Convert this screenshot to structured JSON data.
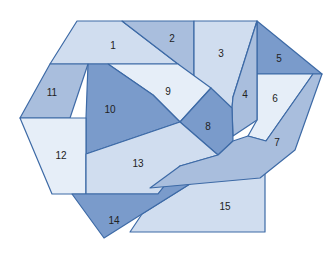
{
  "diagram": {
    "type": "dissection-puzzle",
    "colors": {
      "light": "#e6eef8",
      "pale": "#d0ddef",
      "mid": "#a9bedd",
      "dark": "#7a9bcb",
      "stroke": "#3d6aa6"
    },
    "pieces": [
      {
        "id": "1",
        "label": "1",
        "shade": "pale",
        "points": "77,21 122,21 178,64 50,64",
        "lx": 113,
        "ly": 46
      },
      {
        "id": "2",
        "label": "2",
        "shade": "mid",
        "points": "122,21 194,21 194,86 178,64",
        "lx": 172,
        "ly": 39
      },
      {
        "id": "3",
        "label": "3",
        "shade": "pale",
        "points": "194,21 257,21 233,97 232,108 194,86",
        "lx": 221,
        "ly": 54
      },
      {
        "id": "4",
        "label": "4",
        "shade": "mid",
        "points": "257,21 257,120 233,136 232,108 233,97",
        "lx": 245,
        "ly": 95
      },
      {
        "id": "5",
        "label": "5",
        "shade": "dark",
        "points": "257,21 322,74 257,74",
        "lx": 279,
        "ly": 59
      },
      {
        "id": "6",
        "label": "6",
        "shade": "light",
        "points": "257,74 313,74 266,141 248,136 257,120",
        "lx": 275,
        "ly": 99
      },
      {
        "id": "7",
        "label": "7",
        "shade": "mid",
        "points": "322,74 313,74 266,141 248,136 233,141 218,155 180,166 150,188 260,178 295,150",
        "lx": 277,
        "ly": 143
      },
      {
        "id": "8",
        "label": "8",
        "shade": "dark",
        "points": "211,88 232,108 233,141 218,155 180,122",
        "lx": 208,
        "ly": 127
      },
      {
        "id": "9",
        "label": "9",
        "shade": "light",
        "points": "108,64 178,64 211,88 180,122 153,95",
        "lx": 168,
        "ly": 92
      },
      {
        "id": "10",
        "label": "10",
        "shade": "dark",
        "points": "88,64 108,64 153,95 180,122 86,154 86,118",
        "lx": 110,
        "ly": 110
      },
      {
        "id": "11",
        "label": "11",
        "shade": "mid",
        "points": "50,64 88,64 70,118 20,118",
        "lx": 52,
        "ly": 93
      },
      {
        "id": "12",
        "label": "12",
        "shade": "light",
        "points": "20,118 86,118 86,194 52,194",
        "lx": 61,
        "ly": 156
      },
      {
        "id": "13",
        "label": "13",
        "shade": "pale",
        "points": "86,154 180,122 218,155 180,166 158,194 86,194",
        "lx": 138,
        "ly": 164
      },
      {
        "id": "14",
        "label": "14",
        "shade": "dark",
        "points": "72,194 158,194 180,166 225,162 142,214 104,238",
        "lx": 114,
        "ly": 221
      },
      {
        "id": "15",
        "label": "15",
        "shade": "pale",
        "points": "225,162 265,168 265,232 130,232 142,214",
        "lx": 225,
        "ly": 207
      }
    ]
  }
}
